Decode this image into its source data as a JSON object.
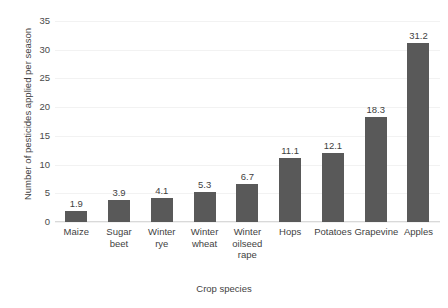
{
  "chart_data": {
    "type": "bar",
    "title": "",
    "xlabel": "Crop species",
    "ylabel": "Number of pesticides applied per season",
    "categories": [
      "Maize",
      "Sugar beet",
      "Winter rye",
      "Winter wheat",
      "Winter oilseed rape",
      "Hops",
      "Potatoes",
      "Grapevine",
      "Apples"
    ],
    "values": [
      1.9,
      3.9,
      4.1,
      5.3,
      6.7,
      11.1,
      12.1,
      18.3,
      31.2
    ],
    "data_labels": [
      "1.9",
      "3.9",
      "4.1",
      "5.3",
      "6.7",
      "11.1",
      "12.1",
      "18.3",
      "31.2"
    ],
    "ylim": [
      0,
      35
    ],
    "yticks": [
      0,
      5,
      10,
      15,
      20,
      25,
      30,
      35
    ],
    "ytick_labels": [
      "0",
      "5",
      "10",
      "15",
      "20",
      "25",
      "30",
      "35"
    ],
    "grid": true,
    "legend": false,
    "bar_color": "#595959",
    "gridline_color": "#f2f2f2",
    "axis_color": "#d9d9d9",
    "text_color": "#3f3f3f"
  }
}
